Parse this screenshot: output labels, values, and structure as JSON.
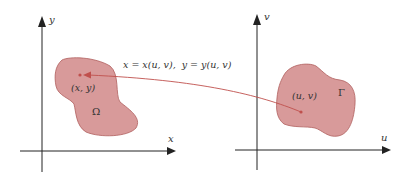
{
  "left_panel": {
    "x_axis_label": "x",
    "y_axis_label": "y",
    "region_label": "Ω",
    "point_label": "(x, y)"
  },
  "right_panel": {
    "u_axis_label": "u",
    "v_axis_label": "v",
    "region_label": "Γ",
    "point_label": "(u, v)"
  },
  "mapping_label": "x = x(u, v),  y = y(u, v)",
  "colors": {
    "region_fill": "#d89a9a",
    "region_stroke": "#b0605e",
    "arrow": "#c0504d",
    "axis": "#222222"
  }
}
